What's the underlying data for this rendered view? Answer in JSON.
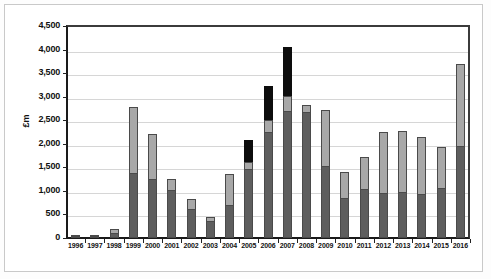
{
  "chart_data": {
    "type": "bar",
    "stacked": true,
    "title": "",
    "subtitle": "",
    "xlabel": "",
    "ylabel": "£m",
    "ylim": [
      0,
      4500
    ],
    "ytick_step": 500,
    "ytick_labels": [
      "0",
      "500",
      "1,000",
      "1,500",
      "2,000",
      "2,500",
      "3,000",
      "3,500",
      "4,000",
      "4,500"
    ],
    "ytick_values": [
      0,
      500,
      1000,
      1500,
      2000,
      2500,
      3000,
      3500,
      4000,
      4500
    ],
    "grid": true,
    "legend": "none",
    "categories": [
      "1996",
      "1997",
      "1998",
      "1999",
      "2000",
      "2001",
      "2002",
      "2003",
      "2004",
      "2005",
      "2006",
      "2007",
      "2008",
      "2009",
      "2010",
      "2011",
      "2012",
      "2013",
      "2014",
      "2015",
      "2016"
    ],
    "series": [
      {
        "name": "dark-grey-segment",
        "color": "#5e5e5e",
        "values": [
          40,
          30,
          100,
          1390,
          1250,
          1010,
          620,
          370,
          700,
          1460,
          2250,
          2690,
          2670,
          1530,
          860,
          1030,
          960,
          980,
          930,
          1060,
          1960
        ]
      },
      {
        "name": "light-grey-segment",
        "color": "#a8a8a8",
        "values": [
          15,
          10,
          90,
          1385,
          950,
          245,
          210,
          70,
          660,
          160,
          250,
          320,
          145,
          1180,
          550,
          695,
          1290,
          1300,
          1210,
          880,
          1740
        ]
      },
      {
        "name": "black-segment",
        "color": "#0d0d0d",
        "values": [
          0,
          0,
          0,
          0,
          0,
          0,
          0,
          0,
          0,
          460,
          720,
          1050,
          0,
          0,
          0,
          0,
          0,
          0,
          0,
          0,
          0
        ]
      }
    ],
    "totals": [
      55,
      40,
      190,
      2775,
      2200,
      1255,
      830,
      440,
      1360,
      2080,
      3220,
      4060,
      2815,
      2710,
      1410,
      1725,
      2250,
      2280,
      2140,
      1940,
      3700
    ]
  }
}
